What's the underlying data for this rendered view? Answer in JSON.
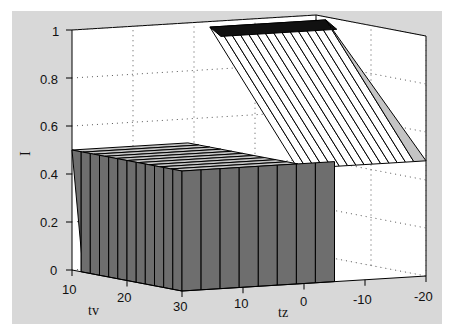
{
  "chart_data": {
    "type": "surface3d",
    "title": "",
    "xlabel": "tv",
    "ylabel": "tz",
    "zlabel": "I",
    "x_ticks": [
      "10",
      "20",
      "30"
    ],
    "x_tick_values": [
      10,
      20,
      30
    ],
    "y_ticks": [
      "10",
      "0",
      "-10",
      "-20"
    ],
    "y_tick_values": [
      10,
      0,
      -10,
      -20
    ],
    "z_ticks": [
      "0",
      "0.2",
      "0.4",
      "0.6",
      "0.8",
      "1"
    ],
    "z_tick_values": [
      0,
      0.2,
      0.4,
      0.6,
      0.8,
      1
    ],
    "xlim": [
      10,
      30
    ],
    "ylim": [
      -20,
      20
    ],
    "zlim": [
      0,
      1
    ],
    "grid": true,
    "surface_description": "Step-like surface: I ≈ 0.5 (dark/gray face) for tz above ~-5 and low tv edge, rising to I ≈ 1 plateau at back (tz > 0, tv region), dropping to 0 for tz < -5",
    "surface_levels": [
      0,
      0.5,
      1
    ],
    "colors": {
      "background": "#d8d8d8",
      "axes_face": "#ffffff",
      "surface_dark": "#6e6e6e",
      "surface_light": "#c4c4c4",
      "edge": "#000000"
    }
  }
}
